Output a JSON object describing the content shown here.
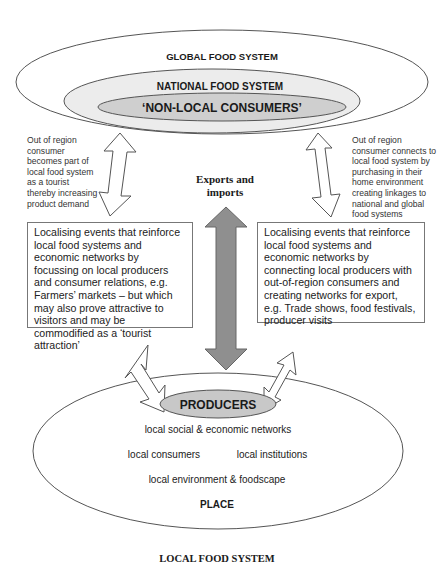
{
  "diagram": {
    "outer_system": {
      "global_label": "GLOBAL FOOD SYSTEM",
      "national_label": "NATIONAL FOOD SYSTEM",
      "non_local_label": "‘NON-LOCAL CONSUMERS’"
    },
    "left_note": "Out of region\nconsumer\nbecomes part of\nlocal food system\nas a tourist\nthereby increasing\nproduct demand",
    "right_note": "Out of region\nconsumer connects to\nlocal food system by\npurchasing in their\nhome environment\ncreating linkages to\nnational and global\nfood systems",
    "center_arrow_label_line1": "Exports and",
    "center_arrow_label_line2": "imports",
    "left_box": "Localising events that reinforce local food systems and economic networks by focussing on local producers and consumer relations, e.g. Farmers’ markets – but which may also prove attractive to visitors and may be commodified as a ‘tourist attraction’",
    "right_box": "Localising events that reinforce local food systems and economic networks by connecting local producers with out-of-region consumers and creating networks for export, e.g. Trade shows, food festivals, producer visits",
    "local_system": {
      "producers_label": "PRODUCERS",
      "line1": "local social & economic networks",
      "line2a": "local consumers",
      "line2b": "local institutions",
      "line3": "local environment & foodscape",
      "place_label": "PLACE"
    },
    "caption": "LOCAL FOOD SYSTEM",
    "colors": {
      "national_fill": "#ececec",
      "non_local_fill": "#cfcfcf",
      "producers_fill": "#c8c8c8",
      "center_arrow_fill": "#8f8f8f",
      "stroke": "#555555"
    }
  }
}
